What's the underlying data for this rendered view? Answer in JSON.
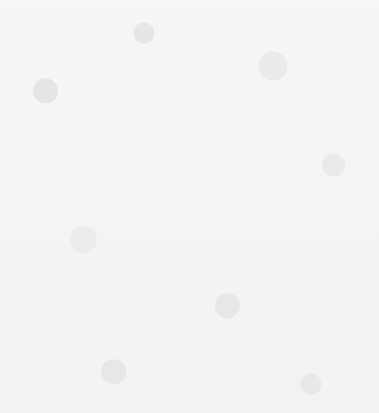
{
  "chart_data": {
    "type": "bar",
    "orientation": "horizontal",
    "title": "",
    "subtitle": "",
    "xlabel": "",
    "ylabel": "",
    "grid": false,
    "legend": "none",
    "xlim": [
      0.4,
      21.2
    ],
    "categories": [
      "LOW TECHNOLOGY",
      "Food, beverages and tobacco",
      "Wood and wood products",
      "Other manufacturing",
      "Publishing,  printing and reproduction of recorded media",
      "Textiles, clothing and leather",
      "LOW-MEDIUM TECHNOLOGY",
      "Chemicals and chemical products",
      "Metal and metal products",
      "Rubber and plastic products",
      "Non-metallic mineral products",
      "MEDIUM-HIGH TECHNOLOGY",
      "Motor vehicles and other transport equipment",
      "Machinery and equipment",
      "Electrical and electronic equipment",
      "HIGH TECHNOLOGY",
      "Precision instruments"
    ],
    "values": [
      18.2,
      20.5,
      19.2,
      19.1,
      17.4,
      16.9,
      18.4,
      19.0,
      18.8,
      17.9,
      16.6,
      19.0,
      16.4,
      17.1,
      20.1,
      16.5,
      16.5
    ],
    "value_labels": [
      "18.2",
      "20.5",
      "19.2",
      "19.1",
      "17.4",
      "16.9",
      "18.4",
      "19.0",
      "18.8",
      "17.9",
      "16.6",
      "19.0",
      "16.4",
      "17.1",
      "20.1",
      "16.5",
      "16.5"
    ],
    "emphasis": [
      true,
      false,
      false,
      false,
      false,
      false,
      true,
      false,
      false,
      false,
      false,
      true,
      false,
      false,
      false,
      true,
      false
    ],
    "bar_color": "#7d7d7d",
    "emphasis_bar_color": "#0a0a0a",
    "reference_line": {
      "value": 18.1,
      "label": "Industry average: 18.1%",
      "style": "dashed",
      "color": "#3a3a3a"
    }
  },
  "rows": [
    {
      "label": "LOW TECHNOLOGY",
      "value": "18.2"
    },
    {
      "label": "Food, beverages and tobacco",
      "value": "20.5"
    },
    {
      "label": "Wood and wood products",
      "value": "19.2"
    },
    {
      "label": "Other manufacturing",
      "value": "19.1"
    },
    {
      "label": "Publishing,  printing and reproduction of recorded media",
      "value": "17.4"
    },
    {
      "label": "Textiles, clothing and leather",
      "value": "16.9"
    },
    {
      "label": "LOW-MEDIUM TECHNOLOGY",
      "value": "18.4"
    },
    {
      "label": "Chemicals and chemical products",
      "value": "19.0"
    },
    {
      "label": "Metal and metal products",
      "value": "18.8"
    },
    {
      "label": "Rubber and plastic products",
      "value": "17.9"
    },
    {
      "label": "Non-metallic mineral products",
      "value": "16.6"
    },
    {
      "label": "MEDIUM-HIGH TECHNOLOGY",
      "value": "19.0"
    },
    {
      "label": "Motor vehicles and other transport equipment",
      "value": "16.4"
    },
    {
      "label": "Machinery and equipment",
      "value": "17.1"
    },
    {
      "label": "Electrical and electronic equipment",
      "value": "20.1"
    },
    {
      "label": "HIGH TECHNOLOGY",
      "value": "16.5"
    },
    {
      "label": "Precision instruments",
      "value": "16.5"
    }
  ],
  "annotation": {
    "industry_average_caption": "Industry average: 18.1%"
  }
}
